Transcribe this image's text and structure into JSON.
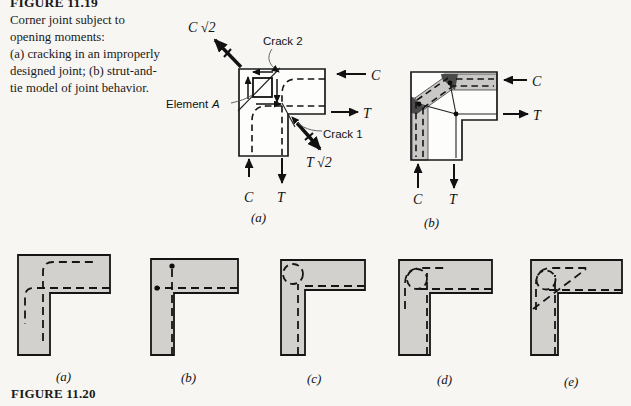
{
  "figure_1119": {
    "number": "FIGURE 11.19",
    "caption_lines": [
      "Corner joint subject to",
      "opening moments:",
      "(a) cracking in an improperly",
      "designed joint; (b) strut-and-",
      "tie model of joint behavior."
    ],
    "panel_a": {
      "label": "(a)",
      "c_sqrt2": "C √2",
      "t_sqrt2": "T √2",
      "crack_1": "Crack 1",
      "crack_2": "Crack 2",
      "element_word": "Element",
      "element_var": "A",
      "c_right": "C",
      "t_right": "T",
      "c_bottom": "C",
      "t_bottom": "T"
    },
    "panel_b": {
      "label": "(b)",
      "c_right": "C",
      "t_right": "T",
      "c_bottom": "C",
      "t_bottom": "T"
    }
  },
  "figure_1120": {
    "number": "FIGURE 11.20",
    "panel_labels": [
      "(a)",
      "(b)",
      "(c)",
      "(d)",
      "(e)"
    ]
  },
  "colors": {
    "background": "#f7f6f3",
    "member_fill": "#d2d1ce",
    "joint_fill": "#fdfdfb",
    "strut_fill": "#c9c8c6",
    "node_fill": "#4a4a4a",
    "ink": "#1a1a1a"
  }
}
